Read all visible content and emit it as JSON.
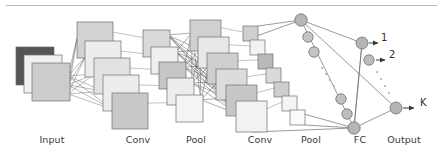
{
  "figure": {
    "background_color": "#ffffff",
    "rule_color": "#b9b9b9",
    "stroke_color": "#6e6e6e",
    "dense_link_color": "#4a4a4a",
    "text_color": "#3a3a3a"
  },
  "layer_labels": [
    {
      "id": "input",
      "text": "Input",
      "x": 52,
      "y": 141
    },
    {
      "id": "conv1",
      "text": "Conv",
      "x": 138,
      "y": 141
    },
    {
      "id": "pool1",
      "text": "Pool",
      "x": 196,
      "y": 141
    },
    {
      "id": "conv2",
      "text": "Conv",
      "x": 260,
      "y": 141
    },
    {
      "id": "pool2",
      "text": "Pool",
      "x": 311,
      "y": 141
    },
    {
      "id": "fc",
      "text": "FC",
      "x": 360,
      "y": 141
    },
    {
      "id": "output",
      "text": "Output",
      "x": 404,
      "y": 141
    }
  ],
  "output_labels": [
    {
      "id": "class-1",
      "text": "1",
      "x": 381,
      "y": 38
    },
    {
      "id": "class-2",
      "text": "2",
      "x": 389,
      "y": 55
    },
    {
      "id": "class-k",
      "text": "K",
      "x": 420,
      "y": 103
    }
  ],
  "input_planes": [
    {
      "x": 16,
      "y": 47,
      "size": 38,
      "fill": "#555555"
    },
    {
      "x": 24,
      "y": 55,
      "size": 38,
      "fill": "#f1f1f1"
    },
    {
      "x": 32,
      "y": 63,
      "size": 38,
      "fill": "#cccccc"
    }
  ],
  "conv1_maps": [
    {
      "x": 77,
      "y": 22,
      "size": 36,
      "fill": "#d2d2d2"
    },
    {
      "x": 85,
      "y": 41,
      "size": 36,
      "fill": "#ededed"
    },
    {
      "x": 94,
      "y": 58,
      "size": 36,
      "fill": "#e2e2e2"
    },
    {
      "x": 103,
      "y": 75,
      "size": 36,
      "fill": "#ececec"
    },
    {
      "x": 112,
      "y": 93,
      "size": 36,
      "fill": "#c9c9c9"
    }
  ],
  "pool1_maps": [
    {
      "x": 143,
      "y": 30,
      "size": 27,
      "fill": "#d9d9d9"
    },
    {
      "x": 151,
      "y": 47,
      "size": 27,
      "fill": "#efefef"
    },
    {
      "x": 159,
      "y": 62,
      "size": 27,
      "fill": "#c6c6c6"
    },
    {
      "x": 167,
      "y": 78,
      "size": 27,
      "fill": "#ededed"
    },
    {
      "x": 176,
      "y": 95,
      "size": 27,
      "fill": "#f4f4f4"
    }
  ],
  "conv2_maps": [
    {
      "x": 190,
      "y": 20,
      "size": 31,
      "fill": "#d0d0d0"
    },
    {
      "x": 198,
      "y": 37,
      "size": 31,
      "fill": "#e8e8e8"
    },
    {
      "x": 207,
      "y": 53,
      "size": 31,
      "fill": "#cfcfcf"
    },
    {
      "x": 216,
      "y": 69,
      "size": 31,
      "fill": "#dcdcdc"
    },
    {
      "x": 226,
      "y": 85,
      "size": 31,
      "fill": "#c7c7c7"
    },
    {
      "x": 236,
      "y": 101,
      "size": 31,
      "fill": "#f2f2f2"
    }
  ],
  "pool2_maps": [
    {
      "x": 243,
      "y": 26,
      "size": 15,
      "fill": "#cfcfcf"
    },
    {
      "x": 250,
      "y": 40,
      "size": 15,
      "fill": "#f3f3f3"
    },
    {
      "x": 258,
      "y": 54,
      "size": 15,
      "fill": "#b9b9b9"
    },
    {
      "x": 266,
      "y": 68,
      "size": 15,
      "fill": "#dadada"
    },
    {
      "x": 274,
      "y": 82,
      "size": 15,
      "fill": "#cdcdcd"
    },
    {
      "x": 282,
      "y": 96,
      "size": 15,
      "fill": "#f4f4f4"
    },
    {
      "x": 290,
      "y": 110,
      "size": 15,
      "fill": "#fbfbfb"
    }
  ],
  "fc_nodes": [
    {
      "cx": 301,
      "cy": 20,
      "r": 6.2,
      "fill": "#b5b5b5"
    },
    {
      "cx": 308,
      "cy": 37,
      "r": 5.2,
      "fill": "#c4c4c4"
    },
    {
      "cx": 314,
      "cy": 52,
      "r": 5.2,
      "fill": "#c4c4c4"
    },
    {
      "cx": 341,
      "cy": 99,
      "r": 5.2,
      "fill": "#c0c0c0"
    },
    {
      "cx": 347,
      "cy": 114,
      "r": 5.2,
      "fill": "#bdbdbd"
    },
    {
      "cx": 354,
      "cy": 128,
      "r": 6.2,
      "fill": "#b5b5b5"
    }
  ],
  "fc_ellipsis": [
    {
      "cx": 322,
      "cy": 68
    },
    {
      "cx": 326,
      "cy": 74
    },
    {
      "cx": 330,
      "cy": 80
    },
    {
      "cx": 334,
      "cy": 86
    }
  ],
  "output_nodes": [
    {
      "id": "out1",
      "cx": 362,
      "cy": 43,
      "r": 6.0,
      "fill": "#b5b5b5"
    },
    {
      "id": "out2",
      "cx": 369,
      "cy": 60,
      "r": 5.2,
      "fill": "#bdbdbd"
    },
    {
      "id": "outK",
      "cx": 396,
      "cy": 108,
      "r": 6.0,
      "fill": "#b5b5b5"
    }
  ],
  "output_ellipsis": [
    {
      "cx": 377,
      "cy": 72
    },
    {
      "cx": 381,
      "cy": 79
    },
    {
      "cx": 385,
      "cy": 86
    },
    {
      "cx": 389,
      "cy": 93
    }
  ],
  "arrows": [
    {
      "id": "arrow-1",
      "x1": 369,
      "y1": 43,
      "x2": 378,
      "y2": 43
    },
    {
      "id": "arrow-2",
      "x1": 376,
      "y1": 60,
      "x2": 385,
      "y2": 60
    },
    {
      "id": "arrow-k",
      "x1": 403,
      "y1": 108,
      "x2": 414,
      "y2": 108
    }
  ]
}
